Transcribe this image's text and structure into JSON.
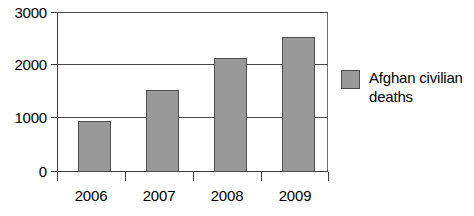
{
  "chart_data": {
    "type": "bar",
    "title": "",
    "subtitle": "",
    "xlabel": "",
    "ylabel": "",
    "categories": [
      "2006",
      "2007",
      "2008",
      "2009"
    ],
    "values": [
      950,
      1540,
      2130,
      2540
    ],
    "series": [
      {
        "name": "Afghan civilian deaths",
        "values": [
          950,
          1540,
          2130,
          2540
        ],
        "color": "#999999"
      }
    ],
    "ylim": [
      0,
      3000
    ],
    "y_ticks": [
      0,
      1000,
      2000,
      3000
    ],
    "y_tick_labels": [
      "0",
      "1000",
      "2000",
      "3000"
    ],
    "grid": true,
    "grid_axis": "y",
    "legend": {
      "position": "right",
      "entries": [
        {
          "label": "Afghan civilian deaths",
          "color": "#999999"
        }
      ]
    }
  },
  "legend": {
    "swatch_name": "legend-color-swatch",
    "label": "Afghan civilian deaths"
  },
  "colors": {
    "bar_fill": "#999999",
    "bar_stroke": "#4d4d4d",
    "axis": "#3d3d3d",
    "grid": "#4a4a4a",
    "background": "#ffffff",
    "text": "#000000"
  }
}
